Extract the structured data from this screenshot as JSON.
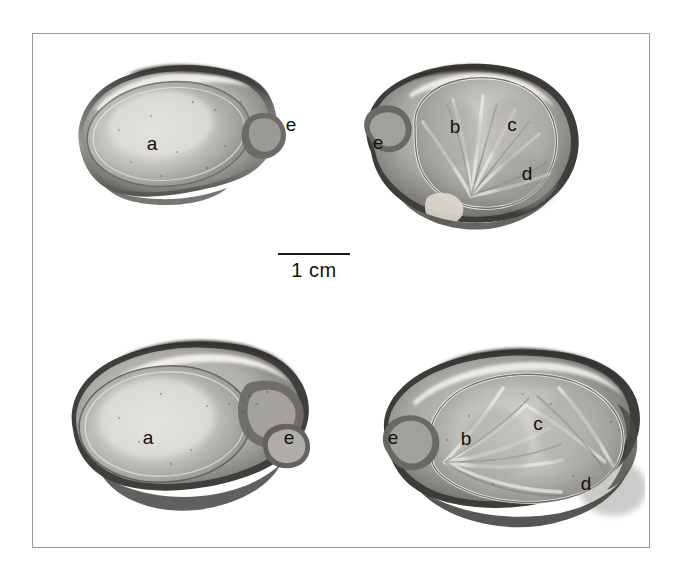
{
  "figure": {
    "kind": "scientific-specimen-plate",
    "background_color": "#ffffff",
    "frame_color": "#9a9a9a",
    "label_color": "#101010"
  },
  "scale_bar": {
    "label": "1 cm",
    "bar_length_px": 72,
    "line_color": "#1a1a1a"
  },
  "specimens": [
    {
      "id": "top-left",
      "view": "left valve interior, oval outline",
      "labels": [
        {
          "key": "a",
          "text": "a",
          "x": 152,
          "y": 143,
          "role": "adductor-muscle-scar"
        },
        {
          "key": "e",
          "text": "e",
          "x": 291,
          "y": 124,
          "role": "hinge-umbo"
        }
      ]
    },
    {
      "id": "top-right",
      "view": "right valve interior, rounded outline with radial ribs",
      "labels": [
        {
          "key": "e",
          "text": "e",
          "x": 378,
          "y": 142,
          "role": "hinge-umbo"
        },
        {
          "key": "b",
          "text": "b",
          "x": 455,
          "y": 126,
          "role": "radial-sector"
        },
        {
          "key": "c",
          "text": "c",
          "x": 512,
          "y": 124,
          "role": "radial-sector"
        },
        {
          "key": "d",
          "text": "d",
          "x": 527,
          "y": 173,
          "role": "radial-sector"
        }
      ]
    },
    {
      "id": "bottom-left",
      "view": "left valve interior, elongate outline",
      "labels": [
        {
          "key": "a",
          "text": "a",
          "x": 148,
          "y": 437,
          "role": "adductor-muscle-scar"
        },
        {
          "key": "e",
          "text": "e",
          "x": 289,
          "y": 437,
          "role": "hinge-umbo"
        }
      ]
    },
    {
      "id": "bottom-right",
      "view": "right valve interior, elongate outline with radial ribs",
      "labels": [
        {
          "key": "e",
          "text": "e",
          "x": 393,
          "y": 437,
          "role": "hinge-umbo"
        },
        {
          "key": "b",
          "text": "b",
          "x": 466,
          "y": 438,
          "role": "radial-sector"
        },
        {
          "key": "c",
          "text": "c",
          "x": 538,
          "y": 423,
          "role": "radial-sector"
        },
        {
          "key": "d",
          "text": "d",
          "x": 586,
          "y": 483,
          "role": "radial-sector"
        }
      ]
    }
  ]
}
